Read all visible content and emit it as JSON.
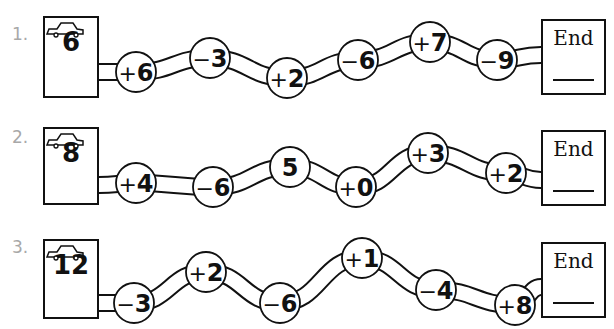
{
  "worksheet": {
    "problems": [
      {
        "number_label": "1.",
        "start_value": "6",
        "start_icon": "car-icon",
        "steps": [
          {
            "op": "+",
            "value": "6"
          },
          {
            "op": "−",
            "value": "3"
          },
          {
            "op": "+",
            "value": "2"
          },
          {
            "op": "−",
            "value": "6"
          },
          {
            "op": "+",
            "value": "7"
          },
          {
            "op": "−",
            "value": "9"
          }
        ],
        "end_label": "End",
        "answer": ""
      },
      {
        "number_label": "2.",
        "start_value": "8",
        "start_icon": "car-icon",
        "steps": [
          {
            "op": "+",
            "value": "4"
          },
          {
            "op": "−",
            "value": "6"
          },
          {
            "op": "",
            "value": "5"
          },
          {
            "op": "+",
            "value": "0"
          },
          {
            "op": "+",
            "value": "3"
          },
          {
            "op": "+",
            "value": "2"
          }
        ],
        "end_label": "End",
        "answer": ""
      },
      {
        "number_label": "3.",
        "start_value": "12",
        "start_icon": "car-icon",
        "steps": [
          {
            "op": "−",
            "value": "3"
          },
          {
            "op": "+",
            "value": "2"
          },
          {
            "op": "−",
            "value": "6"
          },
          {
            "op": "+",
            "value": "1"
          },
          {
            "op": "−",
            "value": "4"
          },
          {
            "op": "+",
            "value": "8"
          }
        ],
        "end_label": "End",
        "answer": ""
      }
    ]
  },
  "colors": {
    "ink": "#111111",
    "label_gray": "#a8a8a8",
    "background": "#ffffff"
  }
}
